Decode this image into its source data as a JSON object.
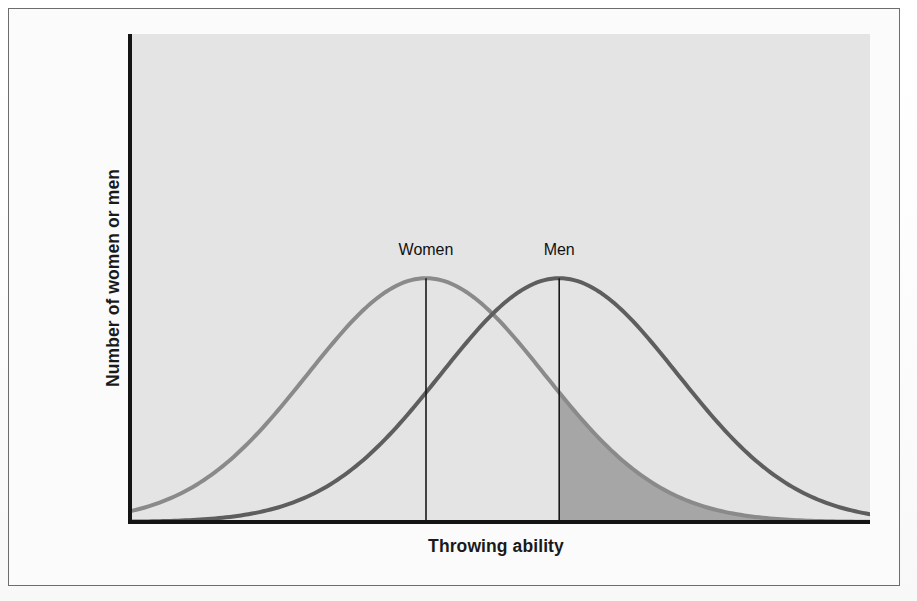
{
  "figure": {
    "background_color": "#fbfbfb",
    "frame_color": "#6d6d6d",
    "plot_background_color": "#e4e4e4",
    "axis_color": "#141414"
  },
  "axes": {
    "y_label": "Number of women or men",
    "x_label": "Throwing ability"
  },
  "annotations": {
    "women_label": "Women",
    "men_label": "Men"
  },
  "chart_data": {
    "type": "line",
    "title": "",
    "subtitle": "",
    "xlabel": "Throwing ability",
    "ylabel": "Number of women or men",
    "grid": false,
    "legend_position": "inline-curve-labels",
    "xlim": [
      0,
      100
    ],
    "ylim": [
      0,
      100
    ],
    "axis_ticks": {
      "x_tick_labels": [],
      "y_tick_labels": []
    },
    "series": [
      {
        "name": "Women",
        "color": "#8a8a8a",
        "line_width": 4,
        "mean": 40,
        "std_dev": 16,
        "peak_value": 51,
        "mean_line": true,
        "label": "Women",
        "label_x": 40,
        "label_y": 60,
        "x": [
          0,
          4,
          8,
          12,
          16,
          20,
          24,
          28,
          32,
          36,
          40,
          44,
          48,
          52,
          56,
          60,
          64,
          68,
          72,
          76,
          80,
          84,
          88,
          92,
          96,
          100
        ],
        "values": [
          0.4,
          1.1,
          2.4,
          4.6,
          8.1,
          13.1,
          19.7,
          27.7,
          36.5,
          45.0,
          51.0,
          50.7,
          46.5,
          39.8,
          31.9,
          24.1,
          17.1,
          11.4,
          7.1,
          4.2,
          2.3,
          1.2,
          0.6,
          0.3,
          0.1,
          0.0
        ]
      },
      {
        "name": "Men",
        "color": "#5e5e5e",
        "line_width": 4,
        "mean": 58,
        "std_dev": 16,
        "peak_value": 51,
        "mean_line": true,
        "label": "Men",
        "label_x": 58,
        "label_y": 60,
        "x": [
          0,
          4,
          8,
          12,
          16,
          20,
          24,
          28,
          32,
          36,
          40,
          44,
          48,
          52,
          56,
          60,
          64,
          68,
          72,
          76,
          80,
          84,
          88,
          92,
          96,
          100
        ],
        "values": [
          0.1,
          0.5,
          1.3,
          2.7,
          5.0,
          8.5,
          13.6,
          20.3,
          28.4,
          37.2,
          45.2,
          50.3,
          51.0,
          47.2,
          39.9,
          31.0,
          22.2,
          14.7,
          9.0,
          5.1,
          2.7,
          1.3,
          0.6,
          0.3,
          0.1,
          0.0
        ]
      }
    ],
    "shaded_region": {
      "description": "Area under the women's curve above the men's mean",
      "series": "Women",
      "from_x": 58,
      "to_x": 100,
      "fill_color": "#a6a6a6",
      "meaning": "women exceeding the male mean"
    },
    "annotations": [
      {
        "text": "Women",
        "x": 40,
        "y": 60,
        "kind": "curve-label"
      },
      {
        "text": "Men",
        "x": 58,
        "y": 60,
        "kind": "curve-label"
      }
    ]
  }
}
